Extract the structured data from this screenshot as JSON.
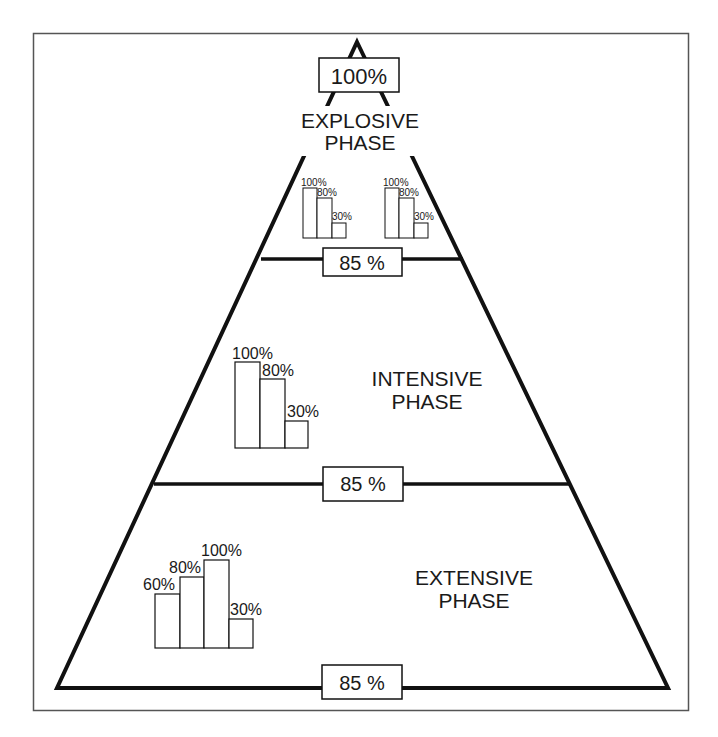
{
  "diagram": {
    "type": "pyramid",
    "apex_label": "100%",
    "phases": [
      {
        "name": "explosive",
        "title_line1": "EXPLOSIVE",
        "title_line2": "PHASE",
        "boundary_label": "85 %",
        "bar_groups": [
          {
            "bars": [
              {
                "label": "100%",
                "value": 100
              },
              {
                "label": "80%",
                "value": 80
              },
              {
                "label": "30%",
                "value": 30
              }
            ]
          },
          {
            "bars": [
              {
                "label": "100%",
                "value": 100
              },
              {
                "label": "80%",
                "value": 80
              },
              {
                "label": "30%",
                "value": 30
              }
            ]
          }
        ]
      },
      {
        "name": "intensive",
        "title_line1": "INTENSIVE",
        "title_line2": "PHASE",
        "boundary_label": "85 %",
        "bar_groups": [
          {
            "bars": [
              {
                "label": "100%",
                "value": 100
              },
              {
                "label": "80%",
                "value": 80
              },
              {
                "label": "30%",
                "value": 30
              }
            ]
          }
        ]
      },
      {
        "name": "extensive",
        "title_line1": "EXTENSIVE",
        "title_line2": "PHASE",
        "boundary_label": "85 %",
        "bar_groups": [
          {
            "bars": [
              {
                "label": "60%",
                "value": 60
              },
              {
                "label": "80%",
                "value": 80
              },
              {
                "label": "100%",
                "value": 100
              },
              {
                "label": "30%",
                "value": 30
              }
            ]
          }
        ]
      }
    ]
  },
  "colors": {
    "stroke": "#111111",
    "frame": "#555555",
    "background": "#ffffff"
  }
}
